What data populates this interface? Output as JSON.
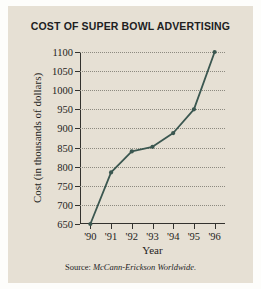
{
  "figure": {
    "background_color": "#e6e0d4",
    "line_color": "#3b5750",
    "grid_color": "#8d8a80",
    "axis_color": "#33322e"
  },
  "source_note": {
    "prefix": "Source:",
    "name": "McCann-Erickson Worldwide."
  },
  "chart_data": {
    "type": "line",
    "title": "COST OF SUPER BOWL ADVERTISING",
    "xlabel": "Year",
    "ylabel": "Cost (in thousands of dollars)",
    "categories": [
      "'90",
      "'91",
      "'92",
      "'93",
      "'94",
      "'95",
      "'96"
    ],
    "values": [
      650,
      785,
      840,
      852,
      888,
      950,
      1100
    ],
    "ylim": [
      650,
      1100
    ],
    "ytick_step": 50,
    "ytick_labels": [
      "650",
      "700",
      "750",
      "800",
      "850",
      "900",
      "950",
      "1000",
      "1050",
      "1100"
    ],
    "ytick_values": [
      650,
      700,
      750,
      800,
      850,
      900,
      950,
      1000,
      1050,
      1100
    ],
    "grid": "horizontal-dotted",
    "legend": "none",
    "markers": "filled-circle",
    "series": [
      {
        "name": "Cost of Super Bowl advertising",
        "values": [
          650,
          785,
          840,
          852,
          888,
          950,
          1100
        ]
      }
    ]
  }
}
